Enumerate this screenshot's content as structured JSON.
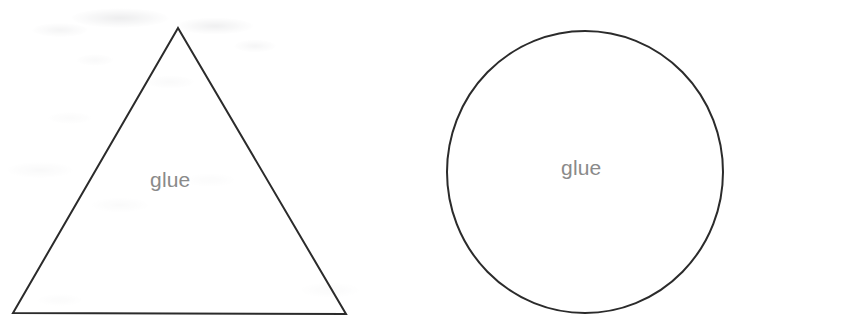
{
  "canvas": {
    "width": 865,
    "height": 322,
    "background_color": "#ffffff",
    "stroke_color": "#2b2b2b",
    "label_color": "#8a8a8a",
    "stroke_width": 2
  },
  "shapes": [
    {
      "id": "triangle",
      "kind": "triangle",
      "label": "glue",
      "points": "178,28 346,314 13,313",
      "apex": {
        "x": 178,
        "y": 28
      },
      "bottom_left": {
        "x": 13,
        "y": 313
      },
      "bottom_right": {
        "x": 346,
        "y": 314
      },
      "label_position": {
        "x": 178,
        "y": 180
      }
    },
    {
      "id": "circle",
      "kind": "circle",
      "label": "glue",
      "center": {
        "x": 585,
        "y": 172
      },
      "radius_x": 138,
      "radius_y": 141,
      "label_position": {
        "x": 587,
        "y": 168
      }
    }
  ]
}
